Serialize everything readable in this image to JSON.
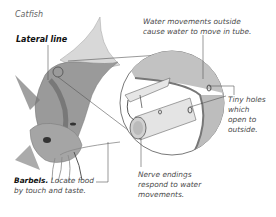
{
  "diagram": {
    "title": "Catfish",
    "labels": {
      "lateral_line": "Lateral line",
      "water_movements_line1": "Water movements outside",
      "water_movements_line2": "cause water to move in tube.",
      "tiny_holes_line1": "Tiny holes",
      "tiny_holes_line2": "which",
      "tiny_holes_line3": "open to",
      "tiny_holes_line4": "outside.",
      "barbels_bold": "Barbels.",
      "barbels_line1": " Locate food",
      "barbels_line2": "by touch and taste.",
      "nerve_line1": "Nerve endings",
      "nerve_line2": "respond to water",
      "nerve_line3": "movements."
    },
    "colors": {
      "line": "#555555",
      "fish_dark": "#6b6b6b",
      "fish_light": "#d0d0d0",
      "magnifier_fill": "#c8c8c8"
    }
  }
}
